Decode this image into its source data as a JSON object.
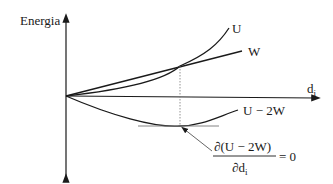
{
  "diagram": {
    "y_axis_label": "Energia",
    "x_axis_label": "d",
    "x_axis_subscript": "i",
    "curves": [
      {
        "name": "U",
        "label": "U"
      },
      {
        "name": "W",
        "label": "W"
      },
      {
        "name": "U-2W",
        "label": "U − 2W"
      }
    ],
    "equation": {
      "numerator": "∂(U − 2W)",
      "denominator_main": "∂d",
      "denominator_sub": "i",
      "rhs": "= 0"
    },
    "colors": {
      "line": "#1a1a1a",
      "guide": "#777777"
    }
  }
}
